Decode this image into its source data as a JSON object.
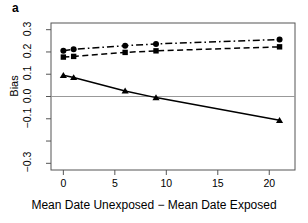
{
  "panel": {
    "label": "a"
  },
  "colors": {
    "axis": "#555555",
    "zero_line": "#999999",
    "series": "#000000",
    "background": "#ffffff"
  },
  "chart_data": {
    "type": "line",
    "title": "",
    "subtitle": "",
    "xlabel": "Mean Date Unexposed − Mean Date Exposed",
    "ylabel": "Bias",
    "xlim": [
      -1.2,
      22.5
    ],
    "ylim": [
      -0.33,
      0.33
    ],
    "grid": false,
    "legend": "none",
    "zero_reference_line": 0.0,
    "xticks": [
      0,
      5,
      10,
      15,
      20
    ],
    "xtick_labels": [
      "0",
      "5",
      "10",
      "15",
      "20"
    ],
    "yticks": [
      0.3,
      0.2,
      0.1,
      0.0,
      -0.1,
      -0.2,
      -0.3
    ],
    "ytick_labels": [
      "0.3",
      "0.2",
      "0.1",
      "0.0",
      "−0.1",
      "",
      "−0.3"
    ],
    "x": [
      0,
      1,
      6,
      9,
      21
    ],
    "series": [
      {
        "name": "series-circle-dashdot",
        "marker": "circle",
        "linestyle": "dashdot",
        "values": [
          0.205,
          0.212,
          0.228,
          0.236,
          0.256
        ]
      },
      {
        "name": "series-square-dashed",
        "marker": "square",
        "linestyle": "dashed",
        "values": [
          0.177,
          0.18,
          0.198,
          0.205,
          0.223
        ]
      },
      {
        "name": "series-triangle-solid",
        "marker": "triangle",
        "linestyle": "solid",
        "values": [
          0.095,
          0.085,
          0.025,
          -0.005,
          -0.107
        ]
      }
    ]
  }
}
